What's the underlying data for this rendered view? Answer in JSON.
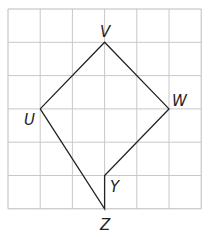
{
  "grid": {
    "cols": 6,
    "rows": 6,
    "origin_px": [
      8,
      9
    ],
    "cell_w": 32.2,
    "cell_h": 33.3,
    "line_color": "#c8c8c8",
    "border_color": "#bbbbbb"
  },
  "shape": {
    "stroke_color": "#222222",
    "points": {
      "V": [
        3,
        1
      ],
      "W": [
        5,
        3
      ],
      "U": [
        1,
        3
      ],
      "Y": [
        3,
        5
      ],
      "Z": [
        3,
        6
      ]
    },
    "path_order": [
      "U",
      "V",
      "W",
      "Y",
      "Z",
      "U"
    ]
  },
  "labels": [
    {
      "name": "V",
      "text": "V",
      "pos": [
        100,
        37
      ]
    },
    {
      "name": "W",
      "text": "W",
      "pos": [
        172,
        106
      ]
    },
    {
      "name": "U",
      "text": "U",
      "pos": [
        24,
        125
      ]
    },
    {
      "name": "Y",
      "text": "Y",
      "pos": [
        110,
        192
      ]
    },
    {
      "name": "Z",
      "text": "Z",
      "pos": [
        100,
        230
      ]
    }
  ]
}
